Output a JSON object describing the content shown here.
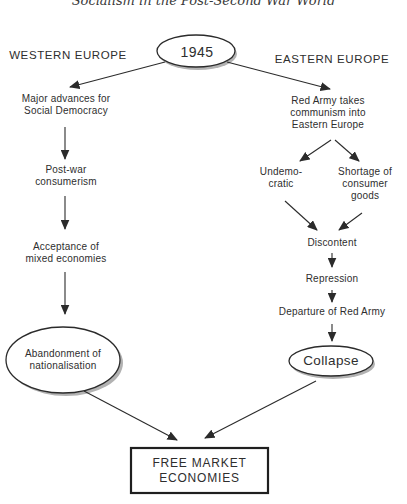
{
  "page_header": {
    "title": "Socialism in the Post-Second War World"
  },
  "colors": {
    "ink": "#2e2e2e",
    "line": "#2b2b2b",
    "ellipse_shadow": "#b2b2b2",
    "node_fill": "#ffffff"
  },
  "diagram": {
    "root_node": "1945",
    "west": {
      "region_label": "WESTERN EUROPE",
      "steps": [
        "Major advances for\nSocial Democracy",
        "Post-war\nconsumerism",
        "Acceptance of\nmixed economies"
      ],
      "end_node": "Abandonment of\nnationalisation"
    },
    "east": {
      "region_label": "EASTERN EUROPE",
      "first_step": "Red Army takes\ncommunism into\nEastern Europe",
      "branches": [
        "Undemo-\ncratic",
        "Shortage of\nconsumer\ngoods"
      ],
      "steps": [
        "Discontent",
        "Repression",
        "Departure of Red Army"
      ],
      "end_node": "Collapse"
    },
    "sink_node": "FREE MARKET\nECONOMIES"
  }
}
